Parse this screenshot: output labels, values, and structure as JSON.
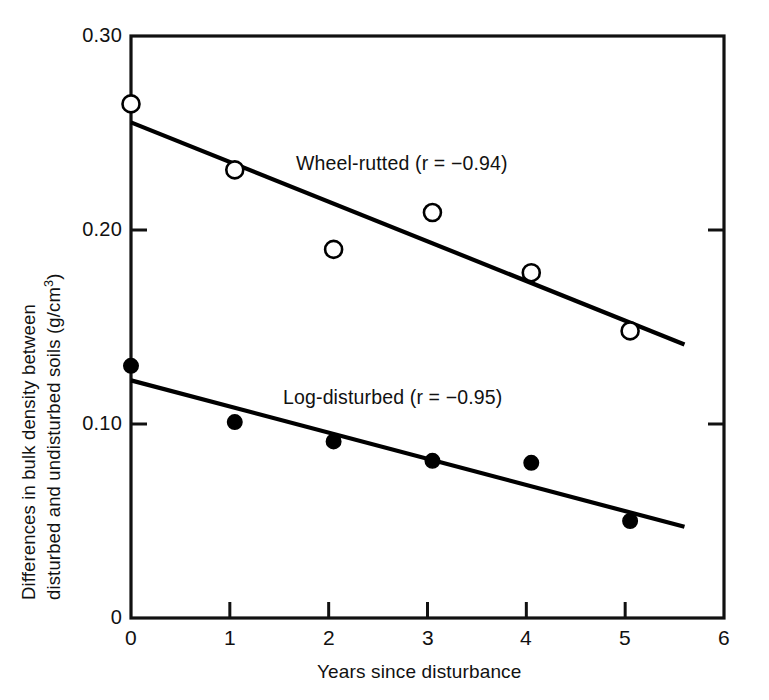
{
  "chart_data": {
    "type": "scatter",
    "title": "",
    "xlabel": "Years since disturbance",
    "ylabel_line1": "Differences in bulk density between",
    "ylabel_line2_pre": "disturbed and undisturbed soils (g/cm",
    "ylabel_exponent": "3",
    "ylabel_line2_post": ")",
    "ylabel_full": "Differences in bulk density between disturbed and undisturbed soils (g/cm3)",
    "xlim": [
      0,
      6
    ],
    "ylim": [
      0,
      0.3
    ],
    "xticks": [
      0,
      1,
      2,
      3,
      4,
      5,
      6
    ],
    "xtick_labels": [
      "0",
      "1",
      "2",
      "3",
      "4",
      "5",
      "6"
    ],
    "yticks": [
      0,
      0.1,
      0.2,
      0.3
    ],
    "ytick_labels": [
      "0",
      "0.10",
      "0.20",
      "0.30"
    ],
    "grid": false,
    "legend_position": "inline-annotation",
    "series": [
      {
        "name": "Wheel-rutted",
        "annotation": "Wheel-rutted (r = −0.94)",
        "correlation": "−0.94",
        "marker": "open-circle",
        "x": [
          0.0,
          1.05,
          2.05,
          3.05,
          4.05,
          5.05
        ],
        "values": [
          0.265,
          0.231,
          0.19,
          0.209,
          0.178,
          0.148
        ],
        "fit_line": {
          "x0": 0.0,
          "y0": 0.2555,
          "x1": 5.6,
          "y1": 0.141
        }
      },
      {
        "name": "Log-disturbed",
        "annotation": "Log-disturbed (r = −0.95)",
        "correlation": "−0.95",
        "marker": "filled-circle",
        "x": [
          0.0,
          1.05,
          2.05,
          3.05,
          4.05,
          5.05
        ],
        "values": [
          0.13,
          0.101,
          0.091,
          0.081,
          0.08,
          0.05
        ],
        "fit_line": {
          "x0": 0.0,
          "y0": 0.1225,
          "x1": 5.6,
          "y1": 0.047
        }
      }
    ],
    "colors": {
      "axis": "#111111",
      "line": "#000000",
      "marker_fill_open": "#ffffff",
      "marker_fill_solid": "#000000",
      "background": "#ffffff"
    },
    "annotations": [
      {
        "text": "Wheel-rutted (r = −0.94)",
        "x": 3.05,
        "y": 0.238
      },
      {
        "text": "Log-disturbed (r = −0.95)",
        "x": 2.52,
        "y": 0.122
      }
    ]
  }
}
